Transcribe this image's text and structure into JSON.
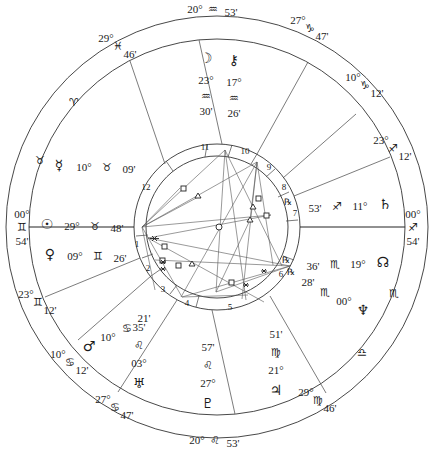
{
  "chart": {
    "center": [
      217,
      227
    ],
    "colors": {
      "line": "#333333",
      "text": "#1a1a1a",
      "background": "#ffffff"
    }
  },
  "cusp_labels": [
    {
      "name": "cusp-mc",
      "deg": "20°",
      "sign": "♒",
      "min": "53'",
      "x": 213,
      "y": 9,
      "layout": "row"
    },
    {
      "name": "cusp-11",
      "deg": "27°",
      "sign": "♑",
      "min": "47'",
      "x": 310,
      "y": 28,
      "layout": "diag"
    },
    {
      "name": "cusp-12",
      "deg": "10°",
      "sign": "♑",
      "min": "12'",
      "x": 365,
      "y": 85,
      "layout": "diag"
    },
    {
      "name": "cusp-1-opp",
      "deg": "23°",
      "sign": "♐",
      "min": "12'",
      "x": 393,
      "y": 148,
      "layout": "diag"
    },
    {
      "name": "cusp-dsc",
      "deg": "00°",
      "sign": "♐",
      "min": "54'",
      "x": 413,
      "y": 227,
      "layout": "col"
    },
    {
      "name": "cusp-asc",
      "deg": "00°",
      "sign": "♊",
      "min": "54'",
      "x": 22,
      "y": 227,
      "layout": "col"
    },
    {
      "name": "cusp-2",
      "deg": "23°",
      "sign": "♊",
      "min": "12'",
      "x": 38,
      "y": 302,
      "layout": "diag"
    },
    {
      "name": "cusp-3",
      "deg": "10°",
      "sign": "♋",
      "min": "12'",
      "x": 70,
      "y": 362,
      "layout": "diag"
    },
    {
      "name": "cusp-4-pre",
      "deg": "27°",
      "sign": "♋",
      "min": "47'",
      "x": 115,
      "y": 407,
      "layout": "diag"
    },
    {
      "name": "cusp-ic",
      "deg": "20°",
      "sign": "♌",
      "min": "53'",
      "x": 215,
      "y": 440,
      "layout": "row"
    },
    {
      "name": "cusp-6",
      "deg": "29°",
      "sign": "♍",
      "min": "46'",
      "x": 318,
      "y": 400,
      "layout": "diag"
    },
    {
      "name": "cusp-ht-left",
      "deg": "29°",
      "sign": "♓",
      "min": "46'",
      "x": 118,
      "y": 46,
      "layout": "diag"
    }
  ],
  "ring_signs": [
    {
      "name": "aries-sign",
      "glyph": "♈",
      "x": 74,
      "y": 102
    },
    {
      "name": "taurus-sign",
      "glyph": "♉",
      "x": 40,
      "y": 160
    },
    {
      "name": "scorpio-sign",
      "glyph": "♏",
      "x": 394,
      "y": 293
    },
    {
      "name": "libra-sign",
      "glyph": "♎",
      "x": 362,
      "y": 352
    }
  ],
  "planets": [
    {
      "name": "moon",
      "glyph": "☽",
      "x": 206,
      "y": 58,
      "deg": "23°",
      "sign": "♒",
      "min": "30'",
      "layout": "vertical"
    },
    {
      "name": "chiron",
      "glyph": "⚷",
      "x": 234,
      "y": 60,
      "deg": "17°",
      "sign": "♒",
      "min": "26'",
      "layout": "vertical"
    },
    {
      "name": "mercury",
      "glyph": "☿",
      "x": 59,
      "y": 165,
      "deg": "10°",
      "sign": "♉",
      "min": "09'",
      "layout": "row"
    },
    {
      "name": "sun",
      "glyph": "☉",
      "x": 47,
      "y": 224,
      "deg": "29°",
      "sign": "♉",
      "min": "48'",
      "layout": "row"
    },
    {
      "name": "venus",
      "glyph": "♀",
      "x": 50,
      "y": 254,
      "deg": "09°",
      "sign": "♊",
      "min": "26'",
      "layout": "row"
    },
    {
      "name": "mars",
      "glyph": "♂",
      "x": 89,
      "y": 346,
      "deg": "10°",
      "sign": "♋",
      "min": "21'",
      "layout": "diag"
    },
    {
      "name": "uranus",
      "glyph": "♅",
      "x": 139,
      "y": 383,
      "deg": "03°",
      "sign": "♌",
      "min": "35'",
      "layout": "vertical-up"
    },
    {
      "name": "pluto",
      "glyph": "♇",
      "x": 208,
      "y": 403,
      "deg": "27°",
      "sign": "♌",
      "min": "57'",
      "layout": "vertical-up"
    },
    {
      "name": "jupiter",
      "glyph": "♃",
      "x": 276,
      "y": 390,
      "deg": "21°",
      "sign": "♍",
      "min": "51'",
      "layout": "vertical-up"
    },
    {
      "name": "neptune",
      "glyph": "♆",
      "x": 363,
      "y": 310,
      "deg": "00°",
      "sign": "♏",
      "min": "28'",
      "retro": "℞",
      "layout": "diag"
    },
    {
      "name": "north-node",
      "glyph": "☊",
      "x": 383,
      "y": 262,
      "deg": "19°",
      "sign": "♏",
      "min": "36'",
      "retro": "℞",
      "layout": "row"
    },
    {
      "name": "saturn",
      "glyph": "♄",
      "x": 385,
      "y": 204,
      "deg": "11°",
      "sign": "♐",
      "min": "53'",
      "retro": "℞",
      "layout": "row"
    }
  ],
  "houses": [
    {
      "num": "11",
      "x": 205,
      "y": 147
    },
    {
      "num": "10",
      "x": 245,
      "y": 151
    },
    {
      "num": "9",
      "x": 269,
      "y": 167
    },
    {
      "num": "8",
      "x": 284,
      "y": 187
    },
    {
      "num": "7",
      "x": 295,
      "y": 213
    },
    {
      "num": "12",
      "x": 146,
      "y": 187
    },
    {
      "num": "1",
      "x": 137,
      "y": 244
    },
    {
      "num": "2",
      "x": 148,
      "y": 268
    },
    {
      "num": "3",
      "x": 163,
      "y": 289
    },
    {
      "num": "4",
      "x": 187,
      "y": 303
    },
    {
      "num": "5",
      "x": 230,
      "y": 307
    },
    {
      "num": "6",
      "x": 281,
      "y": 274
    }
  ]
}
